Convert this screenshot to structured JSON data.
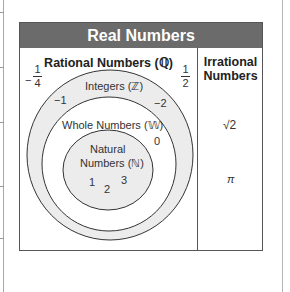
{
  "title": "Real Numbers",
  "rational": {
    "title": "Rational Numbers (ℚ)",
    "fractions": [
      {
        "sign": "−",
        "numerator": "1",
        "denominator": "4"
      },
      {
        "sign": "",
        "numerator": "1",
        "denominator": "2"
      }
    ],
    "integers": {
      "label": "Integers (ℤ)",
      "examples": [
        "−1",
        "−2"
      ]
    },
    "whole": {
      "label": "Whole Numbers (𝕎)",
      "examples": [
        "0"
      ]
    },
    "natural": {
      "label_line1": "Natural",
      "label_line2": "Numbers (ℕ)",
      "examples": [
        "1",
        "2",
        "3"
      ]
    }
  },
  "irrational": {
    "title_line1": "Irrational",
    "title_line2": "Numbers",
    "examples": [
      "√2",
      "π"
    ]
  },
  "colors": {
    "header_bg": "#6b6b6b",
    "ring_fill": "#ececec",
    "border": "#555555"
  }
}
